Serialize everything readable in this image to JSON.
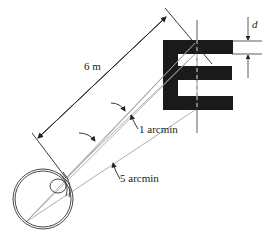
{
  "diagram": {
    "type": "visual-acuity-snellen-E",
    "labels": {
      "distance": "6 m",
      "stroke_width": "d",
      "small_angle": "1 arcmin",
      "large_angle": "5 arcmin"
    },
    "colors": {
      "ink": "#222222",
      "letter": "#1a1a1a",
      "ray": "#9a9a9a",
      "background": "#ffffff"
    }
  }
}
